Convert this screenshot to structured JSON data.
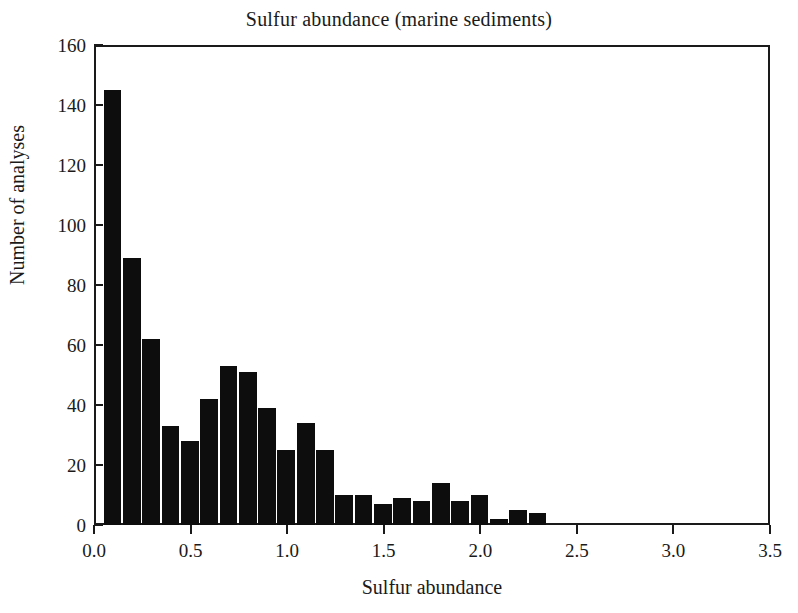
{
  "chart_data": {
    "type": "bar",
    "title": "Sulfur abundance (marine sediments)",
    "xlabel": "Sulfur abundance",
    "ylabel": "Number of analyses",
    "xlim": [
      0.0,
      3.5
    ],
    "ylim": [
      0,
      160
    ],
    "grid": false,
    "legend": null,
    "bin_width": 0.1,
    "bar_color": "#0d0d0d",
    "axis_color": "#1a1a1a",
    "background_color": "#ffffff",
    "xticks": [
      "0.0",
      "0.5",
      "1.0",
      "1.5",
      "2.0",
      "2.5",
      "3.0",
      "3.5"
    ],
    "xtick_values": [
      0.0,
      0.5,
      1.0,
      1.5,
      2.0,
      2.5,
      3.0,
      3.5
    ],
    "yticks": [
      "0",
      "20",
      "40",
      "60",
      "80",
      "100",
      "120",
      "140",
      "160"
    ],
    "ytick_values": [
      0,
      20,
      40,
      60,
      80,
      100,
      120,
      140,
      160
    ],
    "bins": [
      {
        "x0": 0.05,
        "x1": 0.15,
        "value": 145
      },
      {
        "x0": 0.15,
        "x1": 0.25,
        "value": 89
      },
      {
        "x0": 0.25,
        "x1": 0.35,
        "value": 62
      },
      {
        "x0": 0.35,
        "x1": 0.45,
        "value": 33
      },
      {
        "x0": 0.45,
        "x1": 0.55,
        "value": 28
      },
      {
        "x0": 0.55,
        "x1": 0.65,
        "value": 42
      },
      {
        "x0": 0.65,
        "x1": 0.75,
        "value": 53
      },
      {
        "x0": 0.75,
        "x1": 0.85,
        "value": 51
      },
      {
        "x0": 0.85,
        "x1": 0.95,
        "value": 39
      },
      {
        "x0": 0.95,
        "x1": 1.05,
        "value": 25
      },
      {
        "x0": 1.05,
        "x1": 1.15,
        "value": 34
      },
      {
        "x0": 1.15,
        "x1": 1.25,
        "value": 25
      },
      {
        "x0": 1.25,
        "x1": 1.35,
        "value": 10
      },
      {
        "x0": 1.35,
        "x1": 1.45,
        "value": 10
      },
      {
        "x0": 1.45,
        "x1": 1.55,
        "value": 7
      },
      {
        "x0": 1.55,
        "x1": 1.65,
        "value": 9
      },
      {
        "x0": 1.65,
        "x1": 1.75,
        "value": 8
      },
      {
        "x0": 1.75,
        "x1": 1.85,
        "value": 14
      },
      {
        "x0": 1.85,
        "x1": 1.95,
        "value": 8
      },
      {
        "x0": 1.95,
        "x1": 2.05,
        "value": 10
      },
      {
        "x0": 2.05,
        "x1": 2.15,
        "value": 2
      },
      {
        "x0": 2.15,
        "x1": 2.25,
        "value": 5
      },
      {
        "x0": 2.25,
        "x1": 2.35,
        "value": 4
      }
    ]
  }
}
